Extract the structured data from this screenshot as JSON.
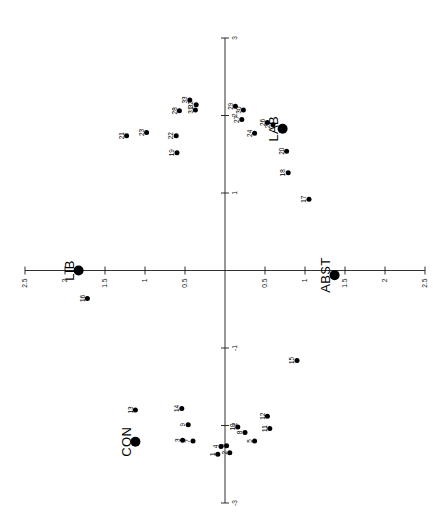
{
  "chart_data": {
    "type": "scatter",
    "title": "",
    "subtitle": "",
    "xlabel": "",
    "ylabel": "",
    "xlim": [
      -2.5,
      2.5
    ],
    "ylim": [
      -3,
      3
    ],
    "grid": false,
    "legend": "none",
    "orientation": "rotated-90-ccw",
    "x_ticks": [
      -2.5,
      -2,
      -1.5,
      -1,
      -0.5,
      0.5,
      1,
      1.5,
      2,
      2.5
    ],
    "x_tick_labels": [
      "2.5",
      "2",
      "1.5",
      "1",
      "0.5",
      "0.5",
      "1",
      "1.5",
      "2",
      "2.5"
    ],
    "y_ticks": [
      3,
      2,
      1,
      -1,
      -2,
      -3
    ],
    "y_tick_labels": [
      "3",
      "2",
      "1",
      "-1",
      "-2",
      "-3"
    ],
    "series": [
      {
        "name": "numbered-items",
        "marker": "filled-circle",
        "marker_size": "small",
        "color": "#000000",
        "points": [
          {
            "label": "1",
            "x": -0.09,
            "y": -2.37
          },
          {
            "label": "2",
            "x": 0.06,
            "y": -2.35
          },
          {
            "label": "3",
            "x": -0.53,
            "y": -2.19
          },
          {
            "label": "4",
            "x": -0.05,
            "y": -2.27
          },
          {
            "label": "5",
            "x": 0.37,
            "y": -2.2
          },
          {
            "label": "6",
            "x": 0.02,
            "y": -2.26
          },
          {
            "label": "7",
            "x": -0.4,
            "y": -2.2
          },
          {
            "label": "8",
            "x": 0.25,
            "y": -2.09
          },
          {
            "label": "9",
            "x": -0.46,
            "y": -1.99
          },
          {
            "label": "10",
            "x": 0.16,
            "y": -2.02
          },
          {
            "label": "11",
            "x": 0.56,
            "y": -2.04
          },
          {
            "label": "12",
            "x": 0.53,
            "y": -1.88
          },
          {
            "label": "13",
            "x": -1.12,
            "y": -1.8
          },
          {
            "label": "14",
            "x": -0.54,
            "y": -1.78
          },
          {
            "label": "15",
            "x": 0.9,
            "y": -1.16
          },
          {
            "label": "16",
            "x": -1.72,
            "y": -0.36
          },
          {
            "label": "17",
            "x": 1.05,
            "y": 0.92
          },
          {
            "label": "18",
            "x": 0.79,
            "y": 1.26
          },
          {
            "label": "19",
            "x": -0.6,
            "y": 1.52
          },
          {
            "label": "20",
            "x": 0.77,
            "y": 1.54
          },
          {
            "label": "21",
            "x": -1.23,
            "y": 1.74
          },
          {
            "label": "22",
            "x": -0.61,
            "y": 1.74
          },
          {
            "label": "23",
            "x": -0.98,
            "y": 1.78
          },
          {
            "label": "24",
            "x": 0.37,
            "y": 1.77
          },
          {
            "label": "25",
            "x": 0.6,
            "y": 1.88
          },
          {
            "label": "26",
            "x": 0.53,
            "y": 1.91
          },
          {
            "label": "27",
            "x": 0.21,
            "y": 1.95
          },
          {
            "label": "28",
            "x": -0.57,
            "y": 2.06
          },
          {
            "label": "29",
            "x": 0.13,
            "y": 2.12
          },
          {
            "label": "30",
            "x": 0.23,
            "y": 2.07
          },
          {
            "label": "31",
            "x": -0.37,
            "y": 2.07
          },
          {
            "label": "32",
            "x": -0.36,
            "y": 2.14
          },
          {
            "label": "33",
            "x": -0.44,
            "y": 2.2
          }
        ]
      },
      {
        "name": "category-points",
        "marker": "filled-circle",
        "marker_size": "large",
        "color": "#000000",
        "points": [
          {
            "label": "LIB",
            "x": -1.83,
            "y": 0.0
          },
          {
            "label": "CON",
            "x": -1.12,
            "y": -2.21
          },
          {
            "label": "LAB",
            "x": 0.72,
            "y": 1.83
          },
          {
            "label": "ABST",
            "x": 1.37,
            "y": -0.06
          }
        ]
      }
    ]
  },
  "colors": {
    "axis": "#1a1a1a",
    "marker": "#000000",
    "background": "#ffffff"
  }
}
